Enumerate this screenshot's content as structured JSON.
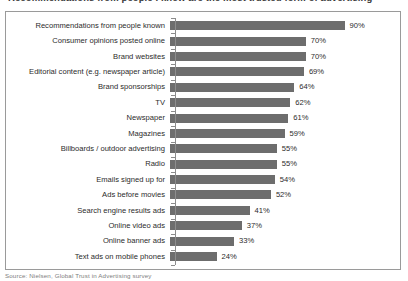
{
  "figure": {
    "clipped_title": "Recommendations from people I know are the most trusted form of advertising",
    "clipped_caption": "Source: Nielsen, Global Trust in Advertising survey"
  },
  "axis": {
    "value_suffix": "%",
    "max_value": 100
  },
  "colors": {
    "bar": "#6d6d6d",
    "frame": "#9a9a9a",
    "axis": "#8d8d8d",
    "text": "#2b2b2b",
    "background": "#ffffff"
  },
  "chart_data": {
    "type": "bar",
    "orientation": "horizontal",
    "title": "Recommendations from people I know are the most trusted form of advertising",
    "subtitle": "",
    "xlabel": "",
    "ylabel": "",
    "xlim": [
      0,
      100
    ],
    "grid": false,
    "legend": "none",
    "data_labels": true,
    "data_label_format": "{v}%",
    "categories": [
      "Recommendations from people known",
      "Consumer opinions posted online",
      "Brand websites",
      "Editorial content (e.g. newspaper article)",
      "Brand sponsorships",
      "TV",
      "Newspaper",
      "Magazines",
      "Billboards / outdoor advertising",
      "Radio",
      "Emails signed up for",
      "Ads before movies",
      "Search engine results ads",
      "Online video ads",
      "Online banner ads",
      "Text ads on mobile phones"
    ],
    "values": [
      90,
      70,
      70,
      69,
      64,
      62,
      61,
      59,
      55,
      55,
      54,
      52,
      41,
      37,
      33,
      24
    ],
    "labels": [
      "90%",
      "70%",
      "70%",
      "69%",
      "64%",
      "62%",
      "61%",
      "59%",
      "55%",
      "55%",
      "54%",
      "52%",
      "41%",
      "37%",
      "33%",
      "24%"
    ],
    "source": "Source: Nielsen, Global Trust in Advertising survey"
  }
}
